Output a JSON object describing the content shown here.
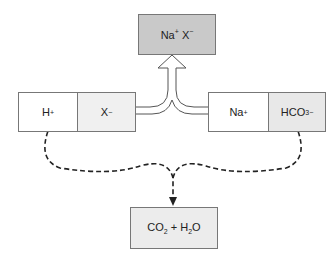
{
  "diagram": {
    "top_box": {
      "label": "Na",
      "sup1": "+",
      "label2": " X",
      "sup2": "−",
      "fill": "#c9c9c9"
    },
    "left_box": {
      "cells": [
        {
          "label": "H",
          "sup": "+",
          "fill": "#ffffff"
        },
        {
          "label": "X",
          "sup": "−",
          "fill": "#f0f0f0"
        }
      ]
    },
    "right_box": {
      "cells": [
        {
          "label": "Na",
          "sup": "+",
          "fill": "#ffffff"
        },
        {
          "label": "HCO",
          "sub": "3",
          "sup": "−",
          "fill": "#e8e8e8"
        }
      ]
    },
    "bottom_box": {
      "label_a": "CO",
      "sub_a": "2",
      "label_b": " + H",
      "sub_b": "2",
      "label_c": "O",
      "fill": "#ececec"
    }
  }
}
